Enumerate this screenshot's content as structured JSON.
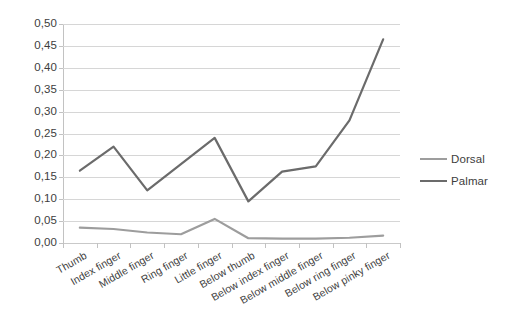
{
  "chart_data": {
    "type": "line",
    "title": "",
    "xlabel": "",
    "ylabel": "",
    "ylim": [
      0.0,
      0.5
    ],
    "ytick_labels": [
      "0,50",
      "0,45",
      "0,40",
      "0,35",
      "0,30",
      "0,25",
      "0,20",
      "0,15",
      "0,10",
      "0,05",
      "0,00"
    ],
    "ytick_values": [
      0.5,
      0.45,
      0.4,
      0.35,
      0.3,
      0.25,
      0.2,
      0.15,
      0.1,
      0.05,
      0.0
    ],
    "grid": true,
    "legend_position": "right",
    "categories": [
      "Thumb",
      "Index finger",
      "Middle finger",
      "Ring finger",
      "Little finger",
      "Below thumb",
      "Below index finger",
      "Below middle finger",
      "Below ring finger",
      "Below pinky finger"
    ],
    "series": [
      {
        "name": "Dorsal",
        "color": "#9d9d9d",
        "values": [
          0.035,
          0.032,
          0.024,
          0.02,
          0.055,
          0.011,
          0.01,
          0.01,
          0.012,
          0.017
        ]
      },
      {
        "name": "Palmar",
        "color": "#6b6b6b",
        "values": [
          0.165,
          0.22,
          0.12,
          0.18,
          0.24,
          0.095,
          0.163,
          0.175,
          0.28,
          0.465
        ]
      }
    ]
  },
  "legend": {
    "items": [
      {
        "label": "Dorsal",
        "color": "#9d9d9d"
      },
      {
        "label": "Palmar",
        "color": "#6b6b6b"
      }
    ]
  },
  "colors": {
    "dorsal": "#9d9d9d",
    "palmar": "#6b6b6b",
    "grid": "#d6d6d6",
    "axis": "#c2c2c2",
    "text": "#3d3d3d",
    "background": "#ffffff"
  }
}
